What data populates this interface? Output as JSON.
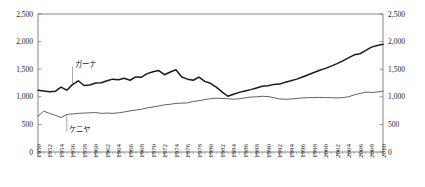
{
  "chart_data": {
    "type": "line",
    "title": "",
    "subtitle": "",
    "xlabel": "",
    "ylabel": "",
    "xlim": [
      1950,
      2010
    ],
    "ylim": [
      0,
      2500
    ],
    "grid": false,
    "legend_position": "inline-annotation",
    "y_ticks": [
      0,
      500,
      1000,
      1500,
      2000,
      2500
    ],
    "y_tick_labels": [
      "0",
      "500",
      "1,000",
      "1,500",
      "2,000",
      "2,500"
    ],
    "y_axis_right_labels": [
      "0",
      "500",
      "1,000",
      "1,500",
      "2,000",
      "2,500"
    ],
    "x_tick_labels": [
      "1950",
      "1952",
      "1954",
      "1956",
      "1958",
      "1960",
      "1962",
      "1964",
      "1966",
      "1968",
      "1970",
      "1972",
      "1974",
      "1976",
      "1978",
      "1980",
      "1982",
      "1984",
      "1986",
      "1988",
      "1990",
      "1992",
      "1994",
      "1996",
      "1998",
      "2000",
      "2002",
      "2004",
      "2006",
      "2008",
      "2010"
    ],
    "x": [
      1950,
      1951,
      1952,
      1953,
      1954,
      1955,
      1956,
      1957,
      1958,
      1959,
      1960,
      1961,
      1962,
      1963,
      1964,
      1965,
      1966,
      1967,
      1968,
      1969,
      1970,
      1971,
      1972,
      1973,
      1974,
      1975,
      1976,
      1977,
      1978,
      1979,
      1980,
      1981,
      1982,
      1983,
      1984,
      1985,
      1986,
      1987,
      1988,
      1989,
      1990,
      1991,
      1992,
      1993,
      1994,
      1995,
      1996,
      1997,
      1998,
      1999,
      2000,
      2001,
      2002,
      2003,
      2004,
      2005,
      2006,
      2007,
      2008,
      2009,
      2010
    ],
    "series": [
      {
        "name": "ガーナ",
        "label": "ガーナ",
        "color": "#1a1a1a",
        "values": [
          1120,
          1105,
          1090,
          1100,
          1175,
          1120,
          1220,
          1290,
          1205,
          1215,
          1250,
          1255,
          1290,
          1320,
          1310,
          1335,
          1300,
          1360,
          1355,
          1420,
          1455,
          1475,
          1400,
          1450,
          1490,
          1360,
          1320,
          1300,
          1355,
          1280,
          1245,
          1175,
          1090,
          1010,
          1045,
          1080,
          1105,
          1130,
          1160,
          1190,
          1200,
          1225,
          1230,
          1265,
          1290,
          1320,
          1360,
          1400,
          1440,
          1480,
          1515,
          1555,
          1600,
          1650,
          1705,
          1760,
          1780,
          1840,
          1900,
          1930,
          1950
        ]
      },
      {
        "name": "ケニヤ",
        "label": "ケニヤ",
        "color": "#3a3a3a",
        "values": [
          650,
          740,
          700,
          665,
          625,
          680,
          690,
          700,
          705,
          710,
          715,
          700,
          705,
          700,
          710,
          725,
          745,
          760,
          775,
          800,
          815,
          835,
          855,
          865,
          880,
          885,
          890,
          915,
          930,
          950,
          965,
          975,
          970,
          965,
          955,
          965,
          980,
          995,
          1000,
          1010,
          1005,
          985,
          960,
          955,
          960,
          970,
          980,
          985,
          985,
          990,
          985,
          985,
          980,
          985,
          1000,
          1035,
          1060,
          1085,
          1080,
          1085,
          1105
        ]
      }
    ],
    "annotations": [
      {
        "text": "ガーナ",
        "series": "ガーナ",
        "x": 1956,
        "y": 1570
      },
      {
        "text": "ケニヤ",
        "series": "ケニヤ",
        "x": 1955,
        "y": 385
      }
    ]
  }
}
